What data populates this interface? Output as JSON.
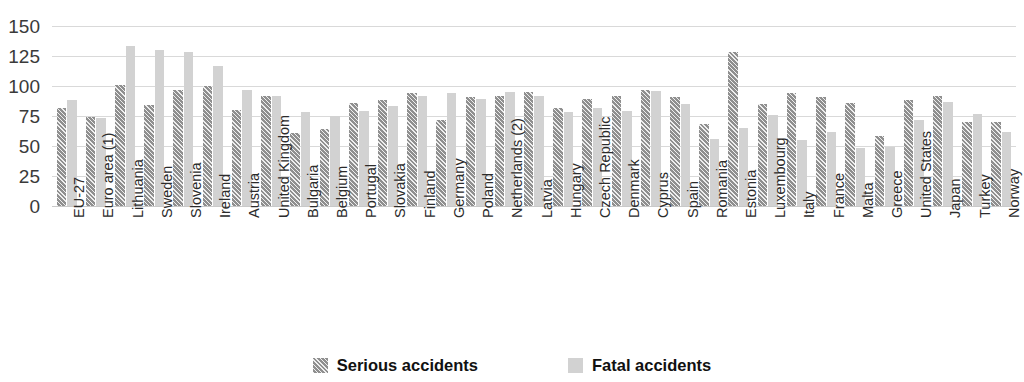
{
  "chart_data": {
    "type": "bar",
    "title": "",
    "xlabel": "",
    "ylabel": "",
    "ylim": [
      0,
      150
    ],
    "yticks": [
      0,
      25,
      50,
      75,
      100,
      125,
      150
    ],
    "grid": true,
    "legend_position": "bottom",
    "categories": [
      "EU-27",
      "Euro area (1)",
      "Lithuania",
      "Sweden",
      "Slovenia",
      "Ireland",
      "Austria",
      "United Kingdom",
      "Bulgaria",
      "Belgium",
      "Portugal",
      "Slovakia",
      "Finland",
      "Germany",
      "Poland",
      "Netherlands (2)",
      "Latvia",
      "Hungary",
      "Czech Republic",
      "Denmark",
      "Cyprus",
      "Spain",
      "Romania",
      "Estonia",
      "Luxembourg",
      "Italy",
      "France",
      "Malta",
      "Greece",
      "United States",
      "Japan",
      "Turkey",
      "Norway"
    ],
    "series": [
      {
        "name": "Serious accidents",
        "color": "#8f8f8f",
        "values": [
          82,
          74,
          101,
          84,
          97,
          100,
          80,
          92,
          61,
          64,
          86,
          88,
          94,
          72,
          91,
          92,
          95,
          82,
          89,
          92,
          97,
          91,
          68,
          128,
          85,
          94,
          91,
          86,
          58,
          88,
          92,
          70,
          70
        ]
      },
      {
        "name": "Fatal accidents",
        "color": "#d2d2d2",
        "values": [
          88,
          73,
          133,
          130,
          128,
          117,
          97,
          92,
          78,
          75,
          79,
          83,
          92,
          94,
          89,
          95,
          92,
          78,
          82,
          79,
          96,
          85,
          56,
          65,
          76,
          55,
          62,
          48,
          49,
          72,
          87,
          77,
          62
        ]
      }
    ]
  },
  "legend": {
    "items": [
      {
        "label": "Serious accidents",
        "swatch": "serious-swatch-icon"
      },
      {
        "label": "Fatal accidents",
        "swatch": "fatal-swatch-icon"
      }
    ]
  },
  "topclip": {
    "text": ""
  }
}
